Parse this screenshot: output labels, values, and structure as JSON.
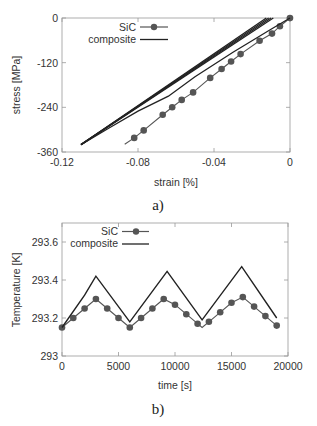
{
  "chart_data": [
    {
      "id": "a",
      "type": "line",
      "caption": "a)",
      "title": "",
      "xlabel": "strain [%]",
      "ylabel": "stress [MPa]",
      "xlim": [
        -0.12,
        0
      ],
      "ylim": [
        -360,
        0
      ],
      "xticks": [
        -0.12,
        -0.08,
        -0.04,
        0
      ],
      "xtick_labels": [
        "-0.12",
        "-0.08",
        "-0.04",
        "0"
      ],
      "yticks": [
        0,
        -120,
        -240,
        -360
      ],
      "ytick_labels": [
        "0",
        "-120",
        "-240",
        "-360"
      ],
      "grid": false,
      "legend_position": "upper left",
      "series": [
        {
          "name": "SiC",
          "style": "line-with-markers",
          "color": "#555555",
          "x": [
            0,
            -0.0053,
            -0.0095,
            -0.016,
            -0.026,
            -0.031,
            -0.036,
            -0.042,
            -0.051,
            -0.057,
            -0.062,
            -0.067,
            -0.077,
            -0.082,
            -0.087
          ],
          "y": [
            0,
            -22,
            -42,
            -61,
            -97,
            -117,
            -137,
            -161,
            -200,
            -220,
            -240,
            -260,
            -302,
            -322,
            -339
          ],
          "markers": [
            true,
            true,
            true,
            true,
            true,
            true,
            true,
            true,
            true,
            true,
            true,
            true,
            true,
            true,
            false
          ]
        },
        {
          "name": "composite",
          "style": "line",
          "color": "#222222",
          "loops": [
            {
              "x": [
                -0.0125,
                -0.11
              ],
              "y": [
                0,
                -340
              ]
            },
            {
              "x": [
                -0.0112,
                -0.11
              ],
              "y": [
                0,
                -340
              ]
            },
            {
              "x": [
                -0.01,
                -0.11
              ],
              "y": [
                0,
                -340
              ]
            },
            {
              "x": [
                -0.0088,
                -0.11
              ],
              "y": [
                0,
                -340
              ]
            },
            {
              "x": [
                0,
                -0.01,
                -0.03,
                -0.05,
                -0.064,
                -0.08,
                -0.095,
                -0.11
              ],
              "y": [
                0,
                -30,
                -92,
                -158,
                -210,
                -250,
                -295,
                -340
              ]
            }
          ]
        }
      ]
    },
    {
      "id": "b",
      "type": "line",
      "caption": "b)",
      "title": "",
      "xlabel": "time [s]",
      "ylabel": "Temperature [K]",
      "xlim": [
        0,
        20000
      ],
      "ylim": [
        293,
        293.7
      ],
      "xticks": [
        0,
        5000,
        10000,
        15000,
        20000
      ],
      "xtick_labels": [
        "0",
        "5000",
        "10000",
        "15000",
        "20000"
      ],
      "yticks": [
        293,
        293.2,
        293.4,
        293.6
      ],
      "ytick_labels": [
        "293",
        "293.2",
        "293.4",
        "293.6"
      ],
      "grid": false,
      "legend_position": "upper left",
      "series": [
        {
          "name": "SiC",
          "style": "line-with-markers",
          "color": "#555555",
          "x": [
            0,
            1000,
            2000,
            3000,
            4000,
            5000,
            6000,
            7000,
            8000,
            9000,
            10000,
            11000,
            12000,
            12400,
            13000,
            14000,
            15000,
            16000,
            17000,
            18000,
            19000
          ],
          "y": [
            293.15,
            293.2,
            293.25,
            293.3,
            293.25,
            293.2,
            293.15,
            293.2,
            293.25,
            293.3,
            293.27,
            293.22,
            293.17,
            293.15,
            293.18,
            293.23,
            293.28,
            293.31,
            293.26,
            293.21,
            293.16
          ],
          "markers": [
            true,
            true,
            true,
            true,
            true,
            true,
            true,
            true,
            true,
            true,
            true,
            true,
            true,
            false,
            true,
            true,
            true,
            true,
            true,
            true,
            true
          ]
        },
        {
          "name": "composite",
          "style": "line",
          "color": "#222222",
          "x": [
            0,
            2000,
            3000,
            6000,
            9300,
            12400,
            15900,
            19000
          ],
          "y": [
            293.15,
            293.32,
            293.42,
            293.18,
            293.445,
            293.19,
            293.47,
            293.2
          ]
        }
      ]
    }
  ]
}
